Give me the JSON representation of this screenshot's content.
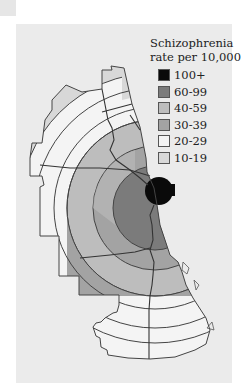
{
  "legend": {
    "title_line1": "Schizophrenia",
    "title_line2": "rate per 10,000",
    "items": [
      {
        "label": "100+",
        "color": "#0a0a0a"
      },
      {
        "label": "60-99",
        "color": "#7b7b7b"
      },
      {
        "label": "40-59",
        "color": "#bdbdbd"
      },
      {
        "label": "30-39",
        "color": "#a3a3a3"
      },
      {
        "label": "20-29",
        "color": "#f4f4f4"
      },
      {
        "label": "10-19",
        "color": "#d8d8d8"
      }
    ]
  },
  "colors": {
    "panel_bg": "#ebebeb",
    "boundary": "#333333",
    "rate_100_plus": "#0a0a0a",
    "rate_60_99": "#7b7b7b",
    "rate_40_59": "#bdbdbd",
    "rate_30_39": "#a3a3a3",
    "rate_20_29": "#f4f4f4",
    "rate_10_19": "#d8d8d8"
  }
}
